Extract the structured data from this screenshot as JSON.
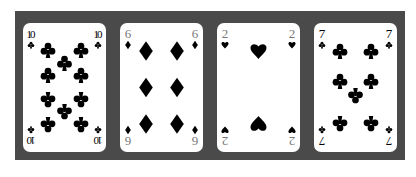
{
  "scene": {
    "description": "Four playing cards laid on a dark gray surface",
    "background_color": "#4a4a4a",
    "card_color": "#ffffff",
    "ink_color": "#000000",
    "rank_color_light": "#777777"
  },
  "cards": [
    {
      "rank": "10",
      "suit": "clubs",
      "suit_symbol": "♣",
      "pips": 10
    },
    {
      "rank": "6",
      "suit": "diamonds",
      "suit_symbol": "♦",
      "pips": 6
    },
    {
      "rank": "2",
      "suit": "hearts",
      "suit_symbol": "♥",
      "pips": 2
    },
    {
      "rank": "7",
      "suit": "clubs",
      "suit_symbol": "♣",
      "pips": 7
    }
  ]
}
